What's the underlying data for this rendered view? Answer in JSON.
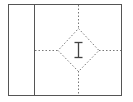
{
  "diagram": {
    "cursor_icon": "i-beam-text-cursor-icon",
    "colors": {
      "frame": "#555555",
      "divider": "#555555",
      "guides": "#777777",
      "cursor": "#444444"
    },
    "regions": [
      {
        "name": "left-panel"
      },
      {
        "name": "main-panel"
      }
    ]
  }
}
